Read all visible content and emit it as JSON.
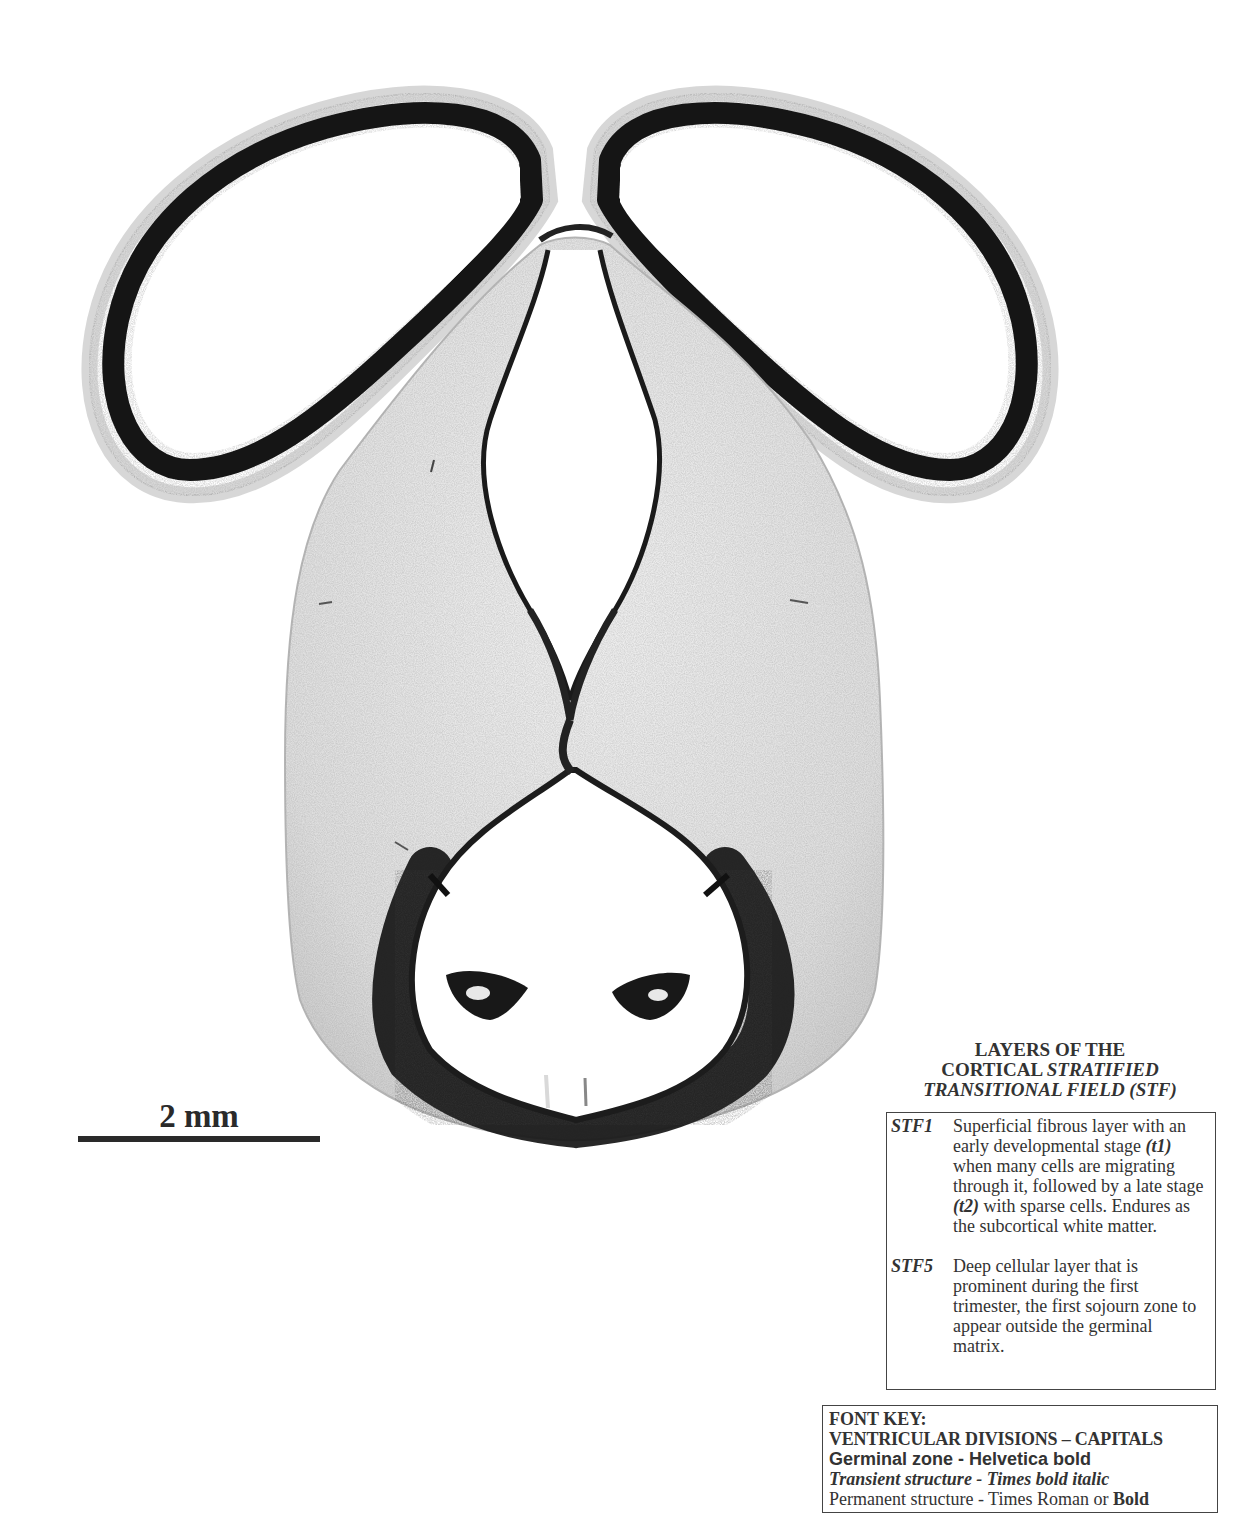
{
  "figure": {
    "type": "histological-section-diagram",
    "scalebar": {
      "label": "2 mm"
    }
  },
  "legend": {
    "title_line1": "LAYERS OF THE",
    "title_line2_plain": "CORTICAL ",
    "title_line2_italic": "STRATIFIED",
    "title_line3_italic": "TRANSITIONAL FIELD (STF)",
    "entries": [
      {
        "code": "STF1",
        "desc_part1": "Superficial fibrous layer with an early developmental stage ",
        "term1": "(t1)",
        "desc_part2": " when many cells are migrating through it, followed by a late stage ",
        "term2": "(t2)",
        "desc_part3": " with sparse cells.  Endures as the subcortical white matter."
      },
      {
        "code": "STF5",
        "desc": "Deep cellular layer that is prominent during the first trimester, the first sojourn zone to appear outside the germinal matrix."
      }
    ]
  },
  "font_key": {
    "title": "FONT KEY:",
    "line_caps": "VENTRICULAR DIVISIONS – CAPITALS",
    "line_germinal": "Germinal zone - Helvetica bold",
    "line_transient": "Transient structure - Times bold italic",
    "line_permanent_plain": "Permanent structure - Times Roman or ",
    "line_permanent_bold": "Bold"
  },
  "colors": {
    "stain_dark": "#151515",
    "stain_mid": "#8a8a8a",
    "stain_light": "#e6e6e6",
    "background": "#ffffff"
  }
}
